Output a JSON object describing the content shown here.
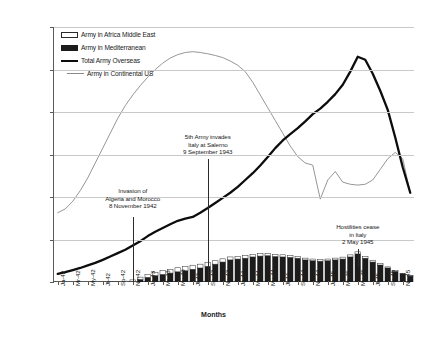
{
  "chart_data": {
    "type": "bar",
    "title": "",
    "xlabel": "Months",
    "ylabel": "",
    "ylim": [
      0,
      6000000
    ],
    "ytick_labels": [
      "0",
      "1,000,000",
      "2,000,000",
      "3,000,000",
      "4,000,000",
      "5,000,000",
      "6,000,000"
    ],
    "ytick_values": [
      0,
      1000000,
      2000000,
      3000000,
      4000000,
      5000000,
      6000000
    ],
    "grid": true,
    "legend_position": "top-left",
    "legend": [
      {
        "label": "Army in Africa Middle East",
        "marker": "open-rect"
      },
      {
        "label": "Army in Mediterranean",
        "marker": "filled-rect"
      },
      {
        "label": "Total Army Overseas",
        "marker": "thick-line"
      },
      {
        "label": "Army in Continental US",
        "marker": "thin-line"
      }
    ],
    "xtick_labels": [
      "Ja-42",
      "Mr-42",
      "My-42",
      "Jl-42",
      "Sp-42",
      "Nv-42",
      "Ja-43",
      "Mr-43",
      "My-43",
      "Jl-43",
      "Sp-43",
      "Nv-43",
      "Ja-44",
      "Mr-44",
      "My-44",
      "Jl-44",
      "Sp-44",
      "Nv-44",
      "Ja-45",
      "Mr-45",
      "My-45",
      "Jl-45",
      "Sp-45",
      "Nv-45"
    ],
    "categories": [
      "Ja-42",
      "Fb-42",
      "Mr-42",
      "Ap-42",
      "My-42",
      "Jn-42",
      "Jl-42",
      "Ag-42",
      "Sp-42",
      "Oc-42",
      "Nv-42",
      "Dc-42",
      "Ja-43",
      "Fb-43",
      "Mr-43",
      "Ap-43",
      "My-43",
      "Jn-43",
      "Jl-43",
      "Ag-43",
      "Sp-43",
      "Oc-43",
      "Nv-43",
      "Dc-43",
      "Ja-44",
      "Fb-44",
      "Mr-44",
      "Ap-44",
      "My-44",
      "Jn-44",
      "Jl-44",
      "Ag-44",
      "Sp-44",
      "Oc-44",
      "Nv-44",
      "Dc-44",
      "Ja-45",
      "Fb-45",
      "Mr-45",
      "Ap-45",
      "My-45",
      "Jn-45",
      "Jl-45",
      "Ag-45",
      "Sp-45",
      "Oc-45",
      "Nv-45",
      "Dc-45"
    ],
    "series": [
      {
        "name": "Army in Mediterranean",
        "type": "bar-stack-bottom",
        "values": [
          0,
          0,
          0,
          0,
          0,
          0,
          0,
          0,
          0,
          0,
          15000,
          60000,
          110000,
          150000,
          180000,
          210000,
          240000,
          265000,
          300000,
          330000,
          370000,
          420000,
          470000,
          520000,
          540000,
          560000,
          590000,
          610000,
          620000,
          600000,
          590000,
          580000,
          560000,
          520000,
          500000,
          490000,
          500000,
          520000,
          540000,
          590000,
          660000,
          560000,
          470000,
          400000,
          330000,
          250000,
          190000,
          140000
        ]
      },
      {
        "name": "Army in Africa Middle East",
        "type": "bar-stack-top",
        "values": [
          0,
          0,
          0,
          0,
          0,
          0,
          5000,
          8000,
          12000,
          20000,
          35000,
          55000,
          70000,
          80000,
          85000,
          90000,
          95000,
          95000,
          95000,
          90000,
          85000,
          80000,
          75000,
          70000,
          65000,
          60000,
          60000,
          58000,
          55000,
          52000,
          50000,
          48000,
          45000,
          42000,
          40000,
          40000,
          40000,
          42000,
          45000,
          48000,
          50000,
          45000,
          38000,
          32000,
          26000,
          20000,
          15000,
          10000
        ]
      },
      {
        "name": "Total Army Overseas",
        "type": "line-thick",
        "values": [
          190000,
          230000,
          280000,
          330000,
          390000,
          450000,
          520000,
          600000,
          680000,
          760000,
          860000,
          960000,
          1080000,
          1180000,
          1270000,
          1360000,
          1440000,
          1490000,
          1530000,
          1630000,
          1740000,
          1860000,
          1980000,
          2100000,
          2240000,
          2400000,
          2560000,
          2740000,
          2940000,
          3150000,
          3330000,
          3480000,
          3620000,
          3780000,
          3950000,
          4080000,
          4240000,
          4420000,
          4640000,
          4950000,
          5300000,
          5230000,
          4900000,
          4500000,
          4050000,
          3400000,
          2700000,
          2100000
        ]
      },
      {
        "name": "Army in Continental US",
        "type": "line-thin",
        "values": [
          1630000,
          1720000,
          1900000,
          2150000,
          2450000,
          2800000,
          3150000,
          3500000,
          3850000,
          4150000,
          4400000,
          4620000,
          4820000,
          5000000,
          5150000,
          5270000,
          5350000,
          5400000,
          5420000,
          5400000,
          5370000,
          5330000,
          5280000,
          5200000,
          5100000,
          4950000,
          4700000,
          4400000,
          4100000,
          3800000,
          3500000,
          3200000,
          2950000,
          2800000,
          2750000,
          1950000,
          2400000,
          2600000,
          2350000,
          2300000,
          2280000,
          2300000,
          2400000,
          2650000,
          2900000,
          3050000,
          2900000,
          2100000
        ]
      }
    ],
    "annotations": [
      {
        "id": "annotation-algeria-morocco",
        "lines": [
          "Invasion of",
          "Algeria and Morocco",
          "8 November 1942"
        ],
        "category": "Nv-42"
      },
      {
        "id": "annotation-salerno",
        "lines": [
          "5th Army invades",
          "Italy at Salerno",
          "9 September 1943"
        ],
        "category": "Sp-43"
      },
      {
        "id": "annotation-hostilities-cease",
        "lines": [
          "Hostilities cease",
          "in Italy",
          "2 May 1945"
        ],
        "category": "My-45"
      }
    ]
  }
}
